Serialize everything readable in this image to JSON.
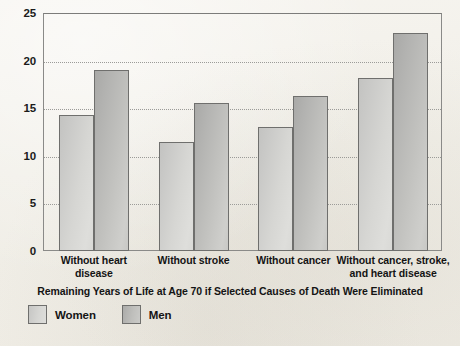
{
  "chart_data": {
    "type": "bar",
    "title": "",
    "xlabel": "Remaining Years of Life at  Age 70 if Selected Causes of Death Were Eliminated",
    "ylabel": "Years",
    "ylim": [
      0,
      25
    ],
    "yticks": [
      0,
      5,
      10,
      15,
      20,
      25
    ],
    "ytick_labels": [
      "0",
      "5",
      "10",
      "15",
      "20",
      "25"
    ],
    "grid": true,
    "grid_style": "dotted horizontal",
    "legend_position": "below-bottom-left",
    "categories": [
      "Without heart disease",
      "Without stroke",
      "Without cancer",
      "Without cancer, stroke, and heart disease"
    ],
    "category_lines": [
      [
        "Without heart",
        "disease"
      ],
      [
        "Without stroke"
      ],
      [
        "Without cancer"
      ],
      [
        "Without cancer, stroke,",
        "and heart disease"
      ]
    ],
    "series": [
      {
        "name": "Women",
        "color": "#d6d6d3",
        "values": [
          14.3,
          11.5,
          13.0,
          18.2
        ]
      },
      {
        "name": "Men",
        "color": "#bdbdba",
        "values": [
          19.0,
          15.6,
          16.3,
          22.9
        ]
      }
    ]
  },
  "axis": {
    "y_title": "Years",
    "caption": "Remaining Years of Life at  Age 70 if Selected Causes of Death Were Eliminated"
  },
  "legend": {
    "items": [
      {
        "label": "Women"
      },
      {
        "label": "Men"
      }
    ]
  }
}
